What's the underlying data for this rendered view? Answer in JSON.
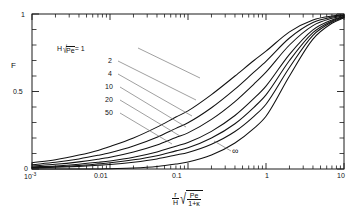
{
  "figure": {
    "kind": "scientific-line-plot",
    "background_color": "#ffffff",
    "line_color": "#111111",
    "leader_color": "#777777"
  },
  "axes": {
    "y_label": "F",
    "y_ticks": [
      "0",
      "0.5",
      "1"
    ],
    "x_ticks": [
      "10",
      "0.01",
      "0.1",
      "1",
      "10"
    ],
    "x_first_tick_mantissa": "10",
    "x_first_tick_exponent": "-3",
    "x_label_parts": {
      "num_r": "r",
      "den_H": "H",
      "radical_num": "Pe",
      "radical_den": "1+κ"
    }
  },
  "legend": {
    "header_prefix": "H",
    "header_radicand": "Pe",
    "header_equals": "= 1",
    "entries": [
      "1",
      "2",
      "4",
      "10",
      "20",
      "50"
    ],
    "infinity_label": "∞"
  },
  "chart_data": {
    "type": "line",
    "title": "",
    "xlabel": "(r/H)·sqrt(Pe/(1+κ))",
    "ylabel": "F",
    "xscale": "log",
    "yscale": "linear",
    "xlim": [
      0.001,
      10
    ],
    "ylim": [
      0,
      1
    ],
    "grid": false,
    "legend_position": "inside-upper-left",
    "x": [
      0.001,
      0.002,
      0.004,
      0.007,
      0.01,
      0.02,
      0.04,
      0.07,
      0.1,
      0.2,
      0.4,
      0.7,
      1.0,
      2.0,
      4.0,
      7.0,
      10.0
    ],
    "series": [
      {
        "name": "H√Pe = 1",
        "label": "1",
        "values": [
          0.04,
          0.06,
          0.09,
          0.12,
          0.145,
          0.2,
          0.27,
          0.335,
          0.375,
          0.48,
          0.6,
          0.7,
          0.76,
          0.885,
          0.962,
          0.987,
          0.995
        ]
      },
      {
        "name": "H√Pe = 2",
        "label": "2",
        "values": [
          0.028,
          0.043,
          0.065,
          0.088,
          0.105,
          0.148,
          0.205,
          0.262,
          0.298,
          0.395,
          0.515,
          0.625,
          0.695,
          0.845,
          0.945,
          0.98,
          0.992
        ]
      },
      {
        "name": "H√Pe = 4",
        "label": "4",
        "values": [
          0.02,
          0.03,
          0.046,
          0.063,
          0.076,
          0.11,
          0.155,
          0.203,
          0.233,
          0.32,
          0.435,
          0.548,
          0.625,
          0.8,
          0.925,
          0.972,
          0.989
        ]
      },
      {
        "name": "H√Pe = 10",
        "label": "10",
        "values": [
          0.013,
          0.02,
          0.031,
          0.043,
          0.052,
          0.076,
          0.11,
          0.147,
          0.171,
          0.243,
          0.345,
          0.455,
          0.535,
          0.74,
          0.898,
          0.962,
          0.985
        ]
      },
      {
        "name": "H√Pe = 20",
        "label": "20",
        "values": [
          0.01,
          0.015,
          0.023,
          0.033,
          0.04,
          0.059,
          0.086,
          0.117,
          0.137,
          0.2,
          0.292,
          0.398,
          0.478,
          0.7,
          0.88,
          0.955,
          0.982
        ]
      },
      {
        "name": "H√Pe = 50",
        "label": "50",
        "values": [
          0.007,
          0.011,
          0.017,
          0.024,
          0.029,
          0.044,
          0.065,
          0.09,
          0.107,
          0.16,
          0.242,
          0.34,
          0.418,
          0.655,
          0.862,
          0.948,
          0.979
        ]
      },
      {
        "name": "H√Pe = ∞",
        "label": "∞",
        "values": [
          0.0,
          0.0,
          0.0,
          0.0,
          0.002,
          0.006,
          0.016,
          0.032,
          0.045,
          0.09,
          0.168,
          0.262,
          0.34,
          0.6,
          0.838,
          0.94,
          0.976
        ]
      }
    ]
  }
}
